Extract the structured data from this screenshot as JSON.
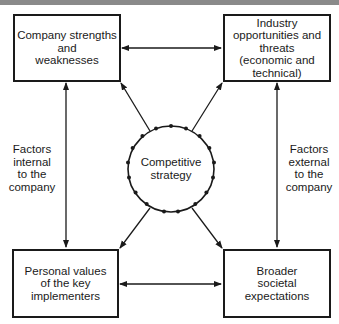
{
  "diagram": {
    "boxes": {
      "top_left": "Company strengths\nand\nweaknesses",
      "top_right": "Industry\nopportunities and\nthreats\n(economic and\ntechnical)",
      "bottom_left": "Personal values\nof the key\nimplementers",
      "bottom_right": "Broader\nsocietal\nexpectations"
    },
    "center": "Competitive\nstrategy",
    "side_labels": {
      "left": "Factors\ninternal\nto the\ncompany",
      "right": "Factors\nexternal\nto the\ncompany"
    },
    "colors": {
      "line": "#1a1a1a",
      "header_strip": "#8a8a8a"
    }
  }
}
